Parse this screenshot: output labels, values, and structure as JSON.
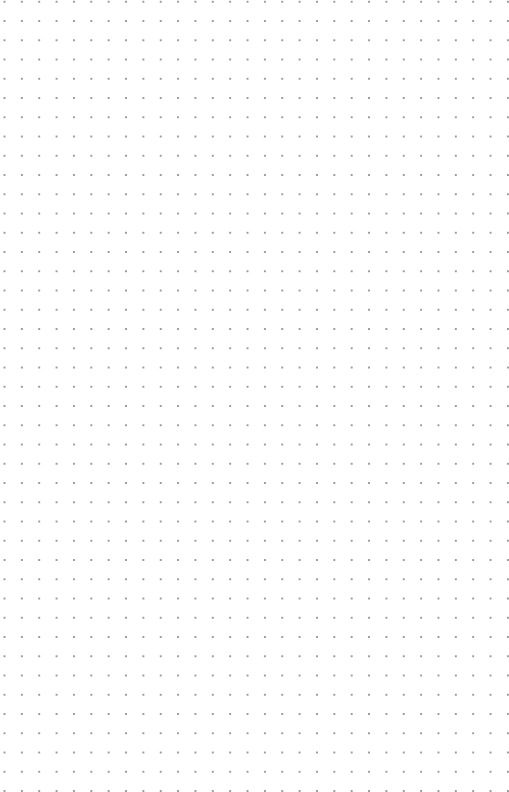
{
  "canvas": {
    "type": "dot-grid",
    "background_color": "#ffffff",
    "dot_color": "#9a9a9a",
    "columns": 29,
    "rows": 40,
    "spacing_x": 17.36,
    "spacing_y": 19.25
  }
}
